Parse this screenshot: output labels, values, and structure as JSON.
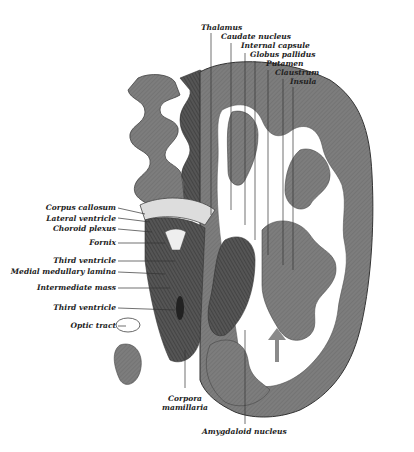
{
  "figure": {
    "labels_top": [
      {
        "id": "thalamus",
        "text": "Thalamus"
      },
      {
        "id": "caudate",
        "text": "Caudate nucleus"
      },
      {
        "id": "internal_capsule",
        "text": "Internal capsule"
      },
      {
        "id": "globus_pallidus",
        "text": "Globus pallidus"
      },
      {
        "id": "putamen",
        "text": "Putamen"
      },
      {
        "id": "claustrum",
        "text": "Claustrum"
      },
      {
        "id": "insula",
        "text": "Insula"
      }
    ],
    "labels_left": [
      {
        "id": "corpus_callosum",
        "text": "Corpus callosum"
      },
      {
        "id": "lateral_ventricle",
        "text": "Lateral ventricle"
      },
      {
        "id": "choroid_plexus",
        "text": "Choroid plexus"
      },
      {
        "id": "fornix",
        "text": "Fornix"
      },
      {
        "id": "third_ventricle_1",
        "text": "Third ventricle"
      },
      {
        "id": "medial_medullary_lamina",
        "text": "Medial medullary lamina"
      },
      {
        "id": "intermediate_mass",
        "text": "Intermediate mass"
      },
      {
        "id": "third_ventricle_2",
        "text": "Third ventricle"
      },
      {
        "id": "optic_tract",
        "text": "Optic tract"
      }
    ],
    "labels_bottom": [
      {
        "id": "corpora_mamillaria",
        "text": "Corpora\nmamillaria",
        "line1": "Corpora",
        "line2": "mamillaria"
      },
      {
        "id": "amygdaloid",
        "text": "Amygdaloid nucleus"
      }
    ],
    "colors": {
      "cortex": "#7a7a7a",
      "white_matter": "#ffffff",
      "dark": "#3a3a3a",
      "line": "#333333",
      "arrow": "#8a8a8a"
    }
  }
}
